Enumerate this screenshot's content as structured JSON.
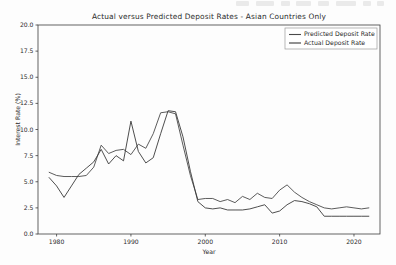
{
  "chart_data": {
    "type": "line",
    "title": "Actual versus Predicted Deposit Rates - Asian Countries Only",
    "xlabel": "Year",
    "ylabel": "Interest Rate (%)",
    "xlim": [
      1977.5,
      2023.5
    ],
    "ylim": [
      0.0,
      20.0
    ],
    "grid": false,
    "legend_position": "upper right",
    "xticks": [
      1980,
      1990,
      2000,
      2010,
      2020
    ],
    "xtick_labels": [
      "1980",
      "1990",
      "2000",
      "2010",
      "2020"
    ],
    "yticks": [
      0.0,
      2.5,
      5.0,
      7.5,
      10.0,
      12.5,
      15.0,
      17.5,
      20.0
    ],
    "ytick_labels": [
      "0.0",
      "2.5",
      "5.0",
      "7.5",
      "10.0",
      "12.5",
      "15.0",
      "17.5",
      "20.0"
    ],
    "x": [
      1979,
      1980,
      1981,
      1982,
      1983,
      1984,
      1985,
      1986,
      1987,
      1988,
      1989,
      1990,
      1991,
      1992,
      1993,
      1994,
      1995,
      1996,
      1997,
      1998,
      1999,
      2000,
      2001,
      2002,
      2003,
      2004,
      2005,
      2006,
      2007,
      2008,
      2009,
      2010,
      2011,
      2012,
      2013,
      2014,
      2015,
      2016,
      2017,
      2018,
      2019,
      2020,
      2021,
      2022
    ],
    "series": [
      {
        "name": "Predicted Deposit Rate",
        "color": "#4a4a4a",
        "values": [
          5.9,
          5.6,
          5.5,
          5.5,
          5.5,
          5.6,
          6.4,
          8.5,
          7.7,
          8.0,
          8.1,
          7.6,
          8.6,
          8.2,
          9.6,
          11.6,
          11.7,
          11.5,
          8.5,
          5.6,
          3.3,
          3.4,
          3.4,
          3.1,
          3.3,
          3.0,
          3.6,
          3.3,
          3.9,
          3.5,
          3.4,
          4.2,
          4.7,
          4.0,
          3.5,
          3.1,
          2.8,
          2.5,
          2.4,
          2.5,
          2.6,
          2.5,
          2.4,
          2.5
        ]
      },
      {
        "name": "Actual Deposit Rate",
        "color": "#3a3a3a",
        "values": [
          5.4,
          4.6,
          3.5,
          4.6,
          5.7,
          6.3,
          6.9,
          8.1,
          6.7,
          7.5,
          7.0,
          10.8,
          7.9,
          6.8,
          7.3,
          9.6,
          11.8,
          11.7,
          9.3,
          6.0,
          3.1,
          2.5,
          2.4,
          2.5,
          2.3,
          2.3,
          2.3,
          2.4,
          2.6,
          2.8,
          2.0,
          2.2,
          2.8,
          3.2,
          3.1,
          2.9,
          2.6,
          1.7,
          1.7,
          1.7,
          1.7,
          1.7,
          1.7,
          1.7
        ]
      }
    ]
  },
  "artifacts": {
    "marks": [
      {
        "left": 0,
        "width": 13
      },
      {
        "left": 20,
        "width": 18
      },
      {
        "left": 45,
        "width": 9
      },
      {
        "left": 60,
        "width": 15
      },
      {
        "left": 82,
        "width": 11
      },
      {
        "left": 100,
        "width": 20
      },
      {
        "left": 127,
        "width": 8
      },
      {
        "left": 141,
        "width": 7
      }
    ]
  }
}
